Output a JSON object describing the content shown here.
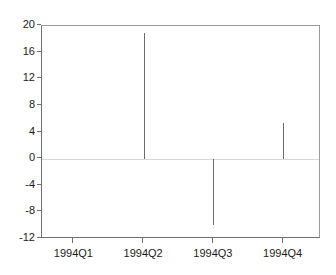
{
  "chart_data": {
    "type": "bar",
    "title": "",
    "subtitle": "",
    "xlabel": "",
    "ylabel": "",
    "categories": [
      "1994Q1",
      "1994Q2",
      "1994Q3",
      "1994Q4"
    ],
    "values": [
      0,
      18.9,
      -9.9,
      5.4
    ],
    "series": [
      {
        "name": "",
        "values": [
          0,
          18.9,
          -9.9,
          5.4
        ]
      }
    ],
    "ylim": [
      -12,
      20
    ],
    "yticks": [
      20,
      16,
      12,
      8,
      4,
      0,
      -4,
      -8,
      -12
    ],
    "ytick_labels": [
      "20",
      "16",
      "12",
      "8",
      "4",
      "0",
      "-4",
      "-8",
      "-12"
    ],
    "xtick_labels": [
      "1994Q1",
      "1994Q2",
      "1994Q3",
      "1994Q4"
    ],
    "grid": false,
    "zero_line": true,
    "legend": false,
    "legend_position": "none",
    "annotations": [],
    "colors": {
      "background": "#ffffff",
      "spike": "#6b6b6b",
      "axis": "#6e6e6e",
      "frame": "#9a9a9a",
      "zero_line": "#d8d8d8",
      "text": "#1a1a1a"
    }
  }
}
